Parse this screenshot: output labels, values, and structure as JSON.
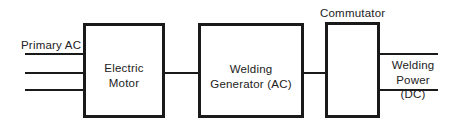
{
  "diagram": {
    "input_label": "Primary AC",
    "blocks": [
      {
        "id": "motor",
        "line1": "Electric",
        "line2": "Motor"
      },
      {
        "id": "generator",
        "line1": "Welding",
        "line2": "Generator (AC)"
      },
      {
        "id": "commutator",
        "label": "Commutator"
      }
    ],
    "output_label": {
      "line1": "Welding",
      "line2": "Power (DC)"
    }
  }
}
